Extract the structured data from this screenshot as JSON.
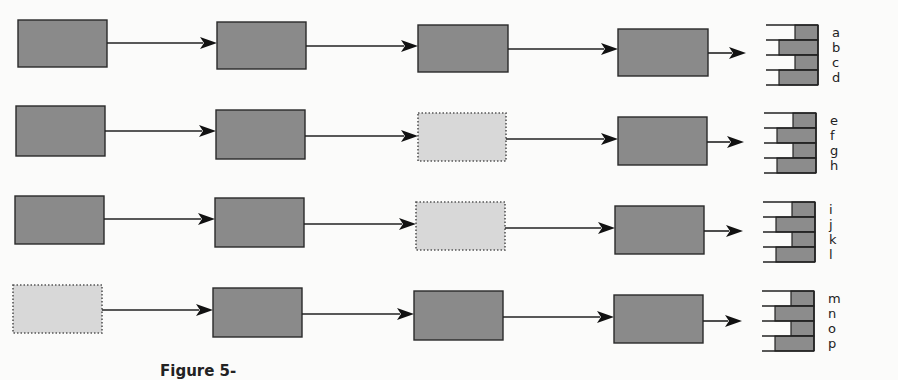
{
  "diagram": {
    "rows": [
      {
        "boxes": [
          {
            "x": 18,
            "y": 20,
            "w": 89,
            "h": 47,
            "style": "solid"
          },
          {
            "x": 217,
            "y": 22,
            "w": 89,
            "h": 47,
            "style": "solid"
          },
          {
            "x": 418,
            "y": 25,
            "w": 90,
            "h": 47,
            "style": "solid"
          },
          {
            "x": 618,
            "y": 29,
            "w": 90,
            "h": 47,
            "style": "solid"
          }
        ],
        "arrow_y": [
          43,
          46,
          49,
          53
        ],
        "stack": {
          "x": 768,
          "y": 25,
          "labels": [
            "a",
            "b",
            "c",
            "d"
          ]
        }
      },
      {
        "boxes": [
          {
            "x": 16,
            "y": 106,
            "w": 89,
            "h": 50,
            "style": "solid"
          },
          {
            "x": 216,
            "y": 110,
            "w": 89,
            "h": 49,
            "style": "solid"
          },
          {
            "x": 418,
            "y": 113,
            "w": 88,
            "h": 48,
            "style": "dotted"
          },
          {
            "x": 618,
            "y": 117,
            "w": 89,
            "h": 48,
            "style": "solid"
          }
        ],
        "arrow_y": [
          131,
          136,
          139,
          142
        ],
        "stack": {
          "x": 766,
          "y": 113,
          "labels": [
            "e",
            "f",
            "g",
            "h"
          ]
        }
      },
      {
        "boxes": [
          {
            "x": 15,
            "y": 196,
            "w": 89,
            "h": 48,
            "style": "solid"
          },
          {
            "x": 215,
            "y": 198,
            "w": 89,
            "h": 49,
            "style": "solid"
          },
          {
            "x": 416,
            "y": 202,
            "w": 89,
            "h": 48,
            "style": "dotted"
          },
          {
            "x": 615,
            "y": 206,
            "w": 89,
            "h": 48,
            "style": "solid"
          }
        ],
        "arrow_y": [
          219,
          224,
          228,
          231
        ],
        "stack": {
          "x": 765,
          "y": 202,
          "labels": [
            "i",
            "j",
            "k",
            "l"
          ]
        }
      },
      {
        "boxes": [
          {
            "x": 13,
            "y": 285,
            "w": 89,
            "h": 48,
            "style": "dotted"
          },
          {
            "x": 213,
            "y": 288,
            "w": 89,
            "h": 49,
            "style": "solid"
          },
          {
            "x": 414,
            "y": 291,
            "w": 89,
            "h": 49,
            "style": "solid"
          },
          {
            "x": 614,
            "y": 295,
            "w": 89,
            "h": 48,
            "style": "solid"
          }
        ],
        "arrow_y": [
          310,
          314,
          317,
          321
        ],
        "stack": {
          "x": 764,
          "y": 291,
          "labels": [
            "m",
            "n",
            "o",
            "p"
          ]
        }
      }
    ],
    "colors": {
      "solid_box": "#8a8a8a",
      "dotted_box": "#d8d8d8",
      "stroke": "#222222",
      "background": "#fbfbfa"
    }
  },
  "caption": {
    "text": "Figure 5-"
  }
}
